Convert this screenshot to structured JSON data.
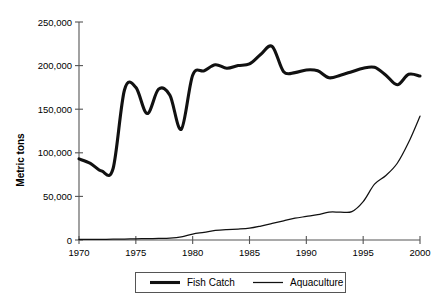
{
  "chart_data": {
    "type": "line",
    "title": "",
    "xlabel": "",
    "ylabel": "Metric tons",
    "xlim": [
      1970,
      2000
    ],
    "ylim": [
      0,
      250000
    ],
    "grid": false,
    "legend_position": "bottom",
    "xticks": [
      "1970",
      "1975",
      "1980",
      "1985",
      "1990",
      "1995",
      "2000"
    ],
    "xtick_values": [
      1970,
      1975,
      1980,
      1985,
      1990,
      1995,
      2000
    ],
    "yticks": [
      "0",
      "50,000",
      "100,000",
      "150,000",
      "200,000",
      "250,000"
    ],
    "ytick_values": [
      0,
      50000,
      100000,
      150000,
      200000,
      250000
    ],
    "x": [
      1970,
      1971,
      1972,
      1973,
      1974,
      1975,
      1976,
      1977,
      1978,
      1979,
      1980,
      1981,
      1982,
      1983,
      1984,
      1985,
      1986,
      1987,
      1988,
      1989,
      1990,
      1991,
      1992,
      1993,
      1994,
      1995,
      1996,
      1997,
      1998,
      1999,
      2000
    ],
    "series": [
      {
        "name": "Fish Catch",
        "line_style": "thick",
        "color": "#111111",
        "values": [
          93000,
          88000,
          79000,
          82000,
          172000,
          175000,
          145000,
          173000,
          166000,
          127000,
          189000,
          194000,
          201000,
          197000,
          200000,
          202000,
          213000,
          222000,
          193000,
          192000,
          195000,
          194000,
          186000,
          189000,
          193000,
          197000,
          198000,
          189000,
          178000,
          190000,
          188000
        ]
      },
      {
        "name": "Aquaculture",
        "line_style": "thin",
        "color": "#111111",
        "values": [
          600,
          700,
          800,
          900,
          1100,
          1300,
          1600,
          1800,
          2100,
          3500,
          6800,
          8800,
          11000,
          12000,
          12500,
          13500,
          16000,
          19000,
          22000,
          25000,
          27000,
          29000,
          32000,
          32000,
          32500,
          44000,
          64000,
          74000,
          88000,
          112000,
          142000
        ]
      }
    ],
    "legend": [
      {
        "name": "Fish Catch",
        "line_style": "thick"
      },
      {
        "name": "Aquaculture",
        "line_style": "thin"
      }
    ]
  }
}
